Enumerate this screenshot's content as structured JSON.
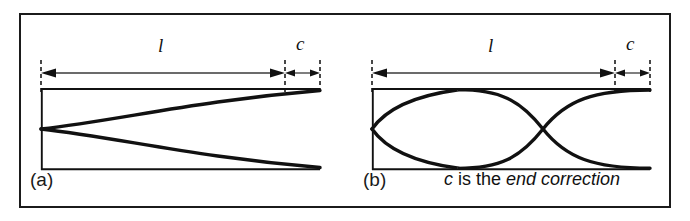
{
  "figure": {
    "background_color": "#ffffff",
    "ink_color": "#111111",
    "frame": {
      "name": "outer-border",
      "x": 20,
      "y": 14,
      "width": 650,
      "height": 193,
      "stroke_width": 2
    },
    "panels": [
      {
        "id": "a",
        "label": "(a)",
        "label_x": 30,
        "label_y": 172,
        "tube": {
          "x": 41,
          "y": 88,
          "width": 279,
          "height": 82
        },
        "wave": {
          "description": "closed-closed fundamental: node at left wall, antinode flare toward right",
          "node_x": 41,
          "node_y": 129,
          "antinode_x": 320,
          "amplitude": 41,
          "harmonic": 1
        },
        "dimension_l": {
          "label": "l",
          "from_x": 41,
          "to_x": 285,
          "y": 73,
          "label_x": 160,
          "label_y": 46
        },
        "dimension_c": {
          "label": "c",
          "from_x": 285,
          "to_x": 320,
          "y": 73,
          "label_x": 297,
          "label_y": 44
        },
        "dashed_guides": [
          41,
          285,
          320
        ]
      },
      {
        "id": "b",
        "label": "(b)",
        "label_x": 363,
        "label_y": 172,
        "tube": {
          "x": 372,
          "y": 88,
          "width": 278,
          "height": 82
        },
        "wave": {
          "description": "second mode: node at left wall, interior node, antinode at open end",
          "node_x": 372,
          "node_y": 129,
          "interior_node_x": 543,
          "antinode_x": 650,
          "amplitude": 41,
          "harmonic": 2
        },
        "dimension_l": {
          "label": "l",
          "from_x": 372,
          "to_x": 615,
          "y": 73,
          "label_x": 490,
          "label_y": 46
        },
        "dimension_c": {
          "label": "c",
          "from_x": 615,
          "to_x": 650,
          "y": 73,
          "label_x": 627,
          "label_y": 44
        },
        "dashed_guides": [
          372,
          615,
          650
        ]
      }
    ],
    "caption": {
      "parts": [
        {
          "text": "c",
          "style": "italic"
        },
        {
          "text": " is the ",
          "style": "normal"
        },
        {
          "text": "end correction",
          "style": "italic"
        }
      ],
      "full_text": "c is the end correction",
      "x": 444,
      "y": 171
    }
  }
}
